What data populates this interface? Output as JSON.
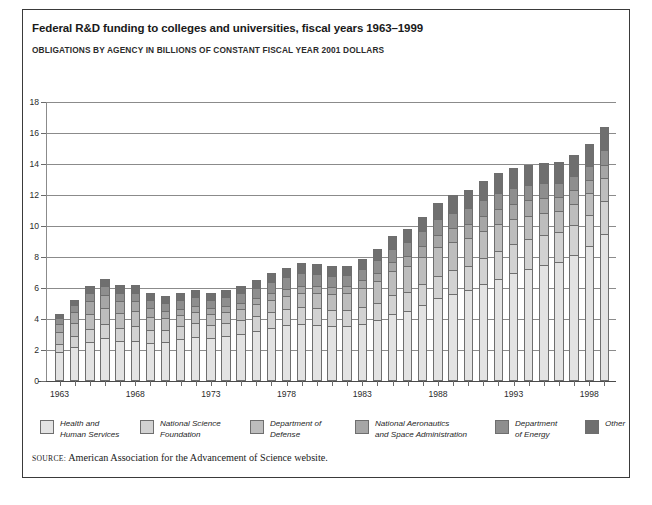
{
  "header": {
    "title": "Federal R&D funding to colleges and universities, fiscal years 1963–1999",
    "subtitle": "OBLIGATIONS BY AGENCY IN BILLIONS OF CONSTANT FISCAL YEAR 2001 DOLLARS"
  },
  "source": {
    "keyword": "SOURCE:",
    "text": "American Association for the Advancement of Science website."
  },
  "legend": {
    "items": [
      {
        "label": "Health and\nHuman Services",
        "color": "#e3e3e3"
      },
      {
        "label": "National Science\nFoundation",
        "color": "#d2d2d2"
      },
      {
        "label": "Department of\nDefense",
        "color": "#bdbdbd"
      },
      {
        "label": "National Aeronautics\nand Space Administration",
        "color": "#a6a6a6"
      },
      {
        "label": "Department\nof Energy",
        "color": "#8e8e8e"
      },
      {
        "label": "Other",
        "color": "#6f6f6f"
      }
    ]
  },
  "chart_data": {
    "type": "bar",
    "stacked": true,
    "title": "Federal R&D funding to colleges and universities, fiscal years 1963–1999",
    "subtitle": "OBLIGATIONS BY AGENCY IN BILLIONS OF CONSTANT FISCAL YEAR 2001 DOLLARS",
    "xlabel": "",
    "ylabel": "Billions of constant fiscal year 2001 dollars",
    "ylim": [
      0,
      18
    ],
    "yticks": [
      0,
      2,
      4,
      6,
      8,
      10,
      12,
      14,
      16,
      18
    ],
    "grid": true,
    "legend_position": "bottom",
    "categories": [
      1963,
      1964,
      1965,
      1966,
      1967,
      1968,
      1969,
      1970,
      1971,
      1972,
      1973,
      1974,
      1975,
      1976,
      1977,
      1978,
      1979,
      1980,
      1981,
      1982,
      1983,
      1984,
      1985,
      1986,
      1987,
      1988,
      1989,
      1990,
      1991,
      1992,
      1993,
      1994,
      1995,
      1996,
      1997,
      1998,
      1999
    ],
    "xtick_labels": [
      "1963",
      "1968",
      "1973",
      "1978",
      "1983",
      "1988",
      "1993",
      "1998"
    ],
    "xtick_years": [
      1963,
      1968,
      1973,
      1978,
      1983,
      1988,
      1993,
      1998
    ],
    "series": [
      {
        "name": "Health and Human Services",
        "color": "#e3e3e3",
        "values": [
          1.85,
          2.2,
          2.5,
          2.75,
          2.55,
          2.6,
          2.45,
          2.5,
          2.7,
          2.85,
          2.75,
          2.9,
          3.05,
          3.25,
          3.45,
          3.6,
          3.7,
          3.6,
          3.55,
          3.55,
          3.7,
          3.95,
          4.35,
          4.5,
          4.9,
          5.35,
          5.6,
          5.85,
          6.25,
          6.6,
          7.0,
          7.25,
          7.5,
          7.7,
          8.1,
          8.7,
          9.5
        ]
      },
      {
        "name": "National Science Foundation",
        "color": "#d2d2d2",
        "values": [
          0.55,
          0.7,
          0.85,
          0.95,
          0.9,
          0.95,
          0.85,
          0.8,
          0.85,
          0.9,
          0.85,
          0.85,
          0.9,
          0.95,
          1.0,
          1.05,
          1.1,
          1.1,
          1.05,
          1.0,
          1.05,
          1.1,
          1.2,
          1.25,
          1.35,
          1.45,
          1.55,
          1.6,
          1.7,
          1.8,
          1.85,
          1.9,
          1.9,
          1.9,
          1.95,
          2.0,
          2.1
        ]
      },
      {
        "name": "Department of Defense",
        "color": "#bdbdbd",
        "values": [
          0.75,
          0.85,
          0.95,
          1.0,
          0.95,
          0.95,
          0.85,
          0.75,
          0.7,
          0.7,
          0.7,
          0.7,
          0.7,
          0.75,
          0.8,
          0.85,
          0.9,
          0.95,
          1.0,
          1.1,
          1.25,
          1.4,
          1.55,
          1.65,
          1.75,
          1.85,
          1.85,
          1.8,
          1.75,
          1.7,
          1.6,
          1.5,
          1.45,
          1.4,
          1.4,
          1.45,
          1.5
        ]
      },
      {
        "name": "National Aeronautics and Space Administration",
        "color": "#a6a6a6",
        "values": [
          0.5,
          0.7,
          0.85,
          0.85,
          0.75,
          0.65,
          0.55,
          0.45,
          0.4,
          0.4,
          0.4,
          0.4,
          0.4,
          0.4,
          0.45,
          0.45,
          0.45,
          0.45,
          0.45,
          0.45,
          0.5,
          0.55,
          0.6,
          0.65,
          0.7,
          0.8,
          0.85,
          0.9,
          0.95,
          1.0,
          1.0,
          1.0,
          0.95,
          0.9,
          0.85,
          0.85,
          0.85
        ]
      },
      {
        "name": "Department of Energy",
        "color": "#8e8e8e",
        "values": [
          0.4,
          0.45,
          0.5,
          0.55,
          0.55,
          0.55,
          0.55,
          0.55,
          0.55,
          0.55,
          0.55,
          0.55,
          0.6,
          0.65,
          0.7,
          0.75,
          0.8,
          0.8,
          0.75,
          0.75,
          0.75,
          0.8,
          0.85,
          0.9,
          0.95,
          1.0,
          1.0,
          1.0,
          1.0,
          1.0,
          1.0,
          1.0,
          0.95,
          0.9,
          0.9,
          0.9,
          0.95
        ]
      },
      {
        "name": "Other",
        "color": "#6f6f6f",
        "values": [
          0.3,
          0.35,
          0.45,
          0.5,
          0.5,
          0.5,
          0.45,
          0.45,
          0.45,
          0.45,
          0.45,
          0.45,
          0.45,
          0.5,
          0.55,
          0.6,
          0.65,
          0.65,
          0.6,
          0.6,
          0.65,
          0.7,
          0.8,
          0.85,
          0.95,
          1.05,
          1.15,
          1.2,
          1.25,
          1.3,
          1.3,
          1.3,
          1.3,
          1.3,
          1.35,
          1.4,
          1.5
        ]
      }
    ],
    "totals": [
      4.35,
      5.25,
      6.1,
      6.6,
      6.2,
      6.2,
      5.7,
      5.5,
      5.65,
      5.85,
      5.7,
      5.85,
      6.1,
      6.5,
      6.95,
      7.3,
      7.6,
      7.55,
      7.4,
      7.45,
      7.9,
      8.5,
      9.35,
      9.8,
      10.6,
      11.5,
      12.0,
      12.35,
      12.9,
      13.4,
      13.75,
      13.95,
      14.05,
      14.1,
      14.55,
      15.3,
      16.4
    ]
  }
}
